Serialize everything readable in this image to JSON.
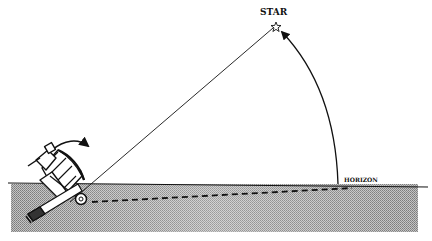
{
  "diagram": {
    "labels": {
      "star": "STAR",
      "horizon": "HORIZON"
    },
    "colors": {
      "ink": "#111111",
      "sea_light": "#d8d8d8",
      "sea_dark": "#9a9a9a",
      "background": "#ffffff"
    },
    "elements": {
      "star_icon": "star-outline",
      "sextant_icon": "sextant",
      "rotation_arrow": "curved-arrow",
      "altitude_arc": "arc-with-arrowhead",
      "sight_line": "solid-line",
      "horizon_line": "dashed-line"
    }
  }
}
